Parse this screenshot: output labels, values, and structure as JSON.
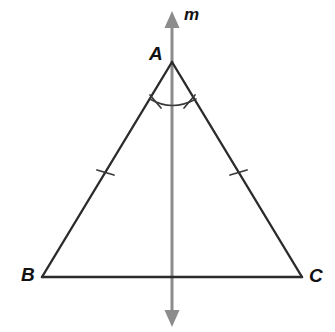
{
  "figure": {
    "kind": "geometry-diagram",
    "background_color": "#ffffff",
    "width": 335,
    "height": 332
  },
  "labels": {
    "vertex_a": "A",
    "vertex_b": "B",
    "vertex_c": "C",
    "line_m": "m"
  },
  "colors": {
    "triangle_stroke": "#2b2b2b",
    "symmetry_line_stroke": "#8c8c8c",
    "tick_stroke": "#3a3a3a",
    "arc_stroke": "#3a3a3a",
    "label_text": "#111111"
  },
  "geometry": {
    "points": {
      "A": {
        "x": 172,
        "y": 62
      },
      "B": {
        "x": 42,
        "y": 277
      },
      "C": {
        "x": 302,
        "y": 277
      }
    },
    "symmetry_line": {
      "name": "m",
      "x": 172,
      "y_top": 12,
      "y_bottom": 326,
      "stroke_width": 3,
      "arrowheads": "both"
    },
    "side_ticks": [
      {
        "side": "AB",
        "x": 105,
        "y": 172,
        "count": 1
      },
      {
        "side": "AC",
        "x": 238,
        "y": 172,
        "count": 1
      }
    ],
    "angle_arc": {
      "vertex": "A",
      "radius": 42,
      "start": {
        "x": 150,
        "y": 99
      },
      "end": {
        "x": 196,
        "y": 99
      },
      "tick_marks": 2
    }
  },
  "annotations": {
    "congruent_sides": [
      "AB",
      "AC"
    ],
    "congruent_angles": [
      "BAM",
      "CAM"
    ]
  }
}
